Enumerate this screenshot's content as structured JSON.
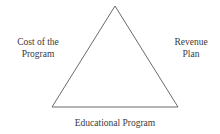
{
  "diagram": {
    "type": "triangle",
    "shape": {
      "stroke_color": "#6b6b6b",
      "fill": "none",
      "stroke_width": 1,
      "apex": {
        "x": 115,
        "y": 6
      },
      "bottom_left": {
        "x": 52,
        "y": 107
      },
      "bottom_right": {
        "x": 178,
        "y": 107
      }
    },
    "labels": {
      "left": {
        "name": "cost-of-the-program",
        "line1": "Cost of the",
        "line2": "Program"
      },
      "right": {
        "name": "revenue-plan",
        "line1": "Revenue",
        "line2": "Plan"
      },
      "bottom": {
        "name": "educational-program",
        "line1": "Educational Program"
      }
    }
  },
  "canvas": {
    "width": "220",
    "height": "134",
    "background": "#ffffff"
  }
}
